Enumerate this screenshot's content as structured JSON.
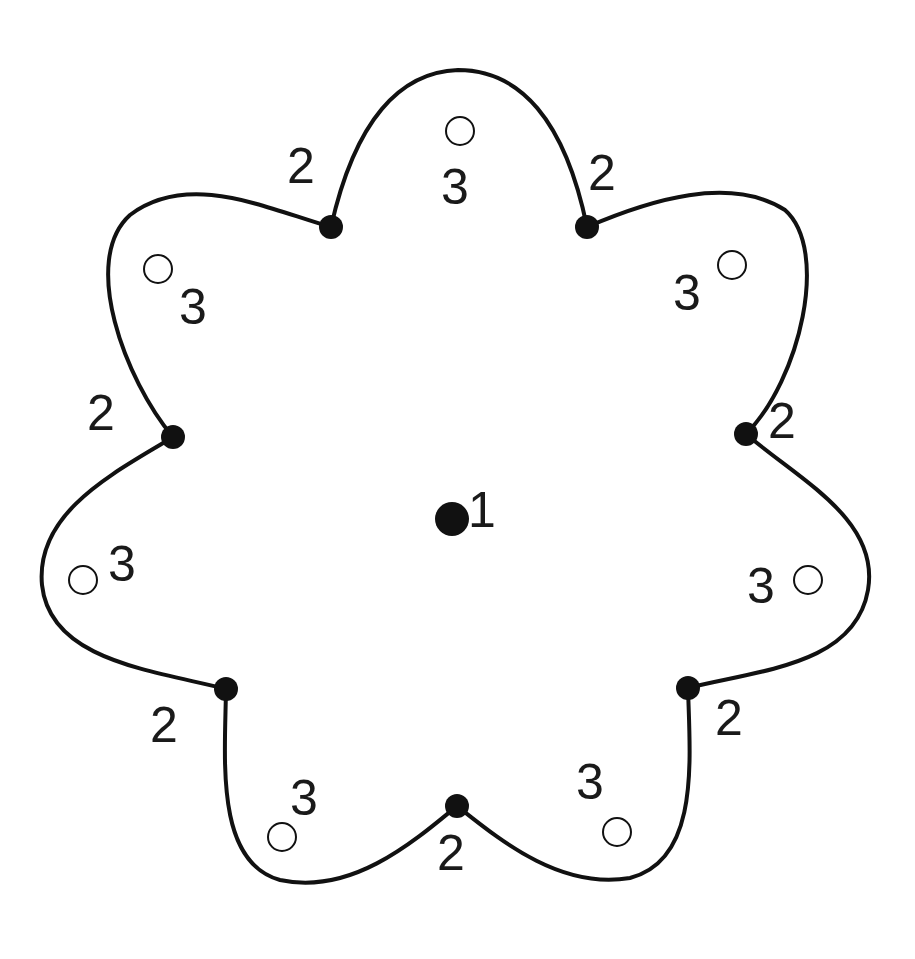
{
  "diagram": {
    "title": "",
    "colors": {
      "stroke": "#111111",
      "background": "#ffffff",
      "text": "#1a1a1a"
    },
    "center": {
      "x": 452,
      "y": 519,
      "label": "1",
      "label_x": 468,
      "label_y": 527
    },
    "vertices": [
      {
        "x": 331,
        "y": 227,
        "label": "2",
        "lx": 287,
        "ly": 183
      },
      {
        "x": 587,
        "y": 227,
        "label": "2",
        "lx": 588,
        "ly": 190
      },
      {
        "x": 746,
        "y": 434,
        "label": "2",
        "lx": 768,
        "ly": 438
      },
      {
        "x": 688,
        "y": 688,
        "label": "2",
        "lx": 715,
        "ly": 735
      },
      {
        "x": 457,
        "y": 806,
        "label": "2",
        "lx": 437,
        "ly": 870
      },
      {
        "x": 226,
        "y": 689,
        "label": "2",
        "lx": 150,
        "ly": 742
      },
      {
        "x": 173,
        "y": 437,
        "label": "2",
        "lx": 87,
        "ly": 430
      }
    ],
    "open_points": [
      {
        "x": 460,
        "y": 131,
        "label": "3",
        "lx": 441,
        "ly": 204
      },
      {
        "x": 732,
        "y": 265,
        "label": "3",
        "lx": 673,
        "ly": 310
      },
      {
        "x": 808,
        "y": 580,
        "label": "3",
        "lx": 747,
        "ly": 603
      },
      {
        "x": 617,
        "y": 832,
        "label": "3",
        "lx": 576,
        "ly": 799
      },
      {
        "x": 282,
        "y": 837,
        "label": "3",
        "lx": 290,
        "ly": 815
      },
      {
        "x": 83,
        "y": 580,
        "label": "3",
        "lx": 108,
        "ly": 581
      },
      {
        "x": 158,
        "y": 269,
        "label": "3",
        "lx": 179,
        "ly": 324
      }
    ]
  }
}
